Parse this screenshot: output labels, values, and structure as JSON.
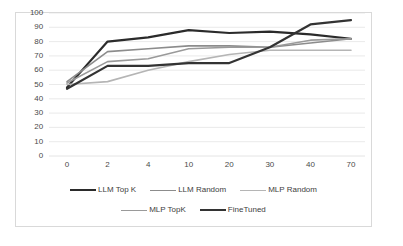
{
  "chart_data": {
    "type": "line",
    "title": "",
    "subtitle": "",
    "xlabel": "",
    "ylabel": "",
    "categories": [
      "0",
      "2",
      "4",
      "10",
      "20",
      "30",
      "40",
      "70"
    ],
    "ylim": [
      0,
      100
    ],
    "y_ticks": [
      "0",
      "10",
      "20",
      "30",
      "40",
      "50",
      "60",
      "70",
      "80",
      "90",
      "100"
    ],
    "grid": "horizontal",
    "legend_position": "bottom",
    "series": [
      {
        "name": "LLM Top K",
        "color": "#2b2b2b",
        "width": 2.2,
        "values": [
          48,
          80,
          83,
          88,
          86,
          87,
          85,
          82
        ]
      },
      {
        "name": "LLM Random",
        "color": "#8c8c8c",
        "width": 1.6,
        "values": [
          52,
          73,
          75,
          77,
          77,
          76,
          79,
          82
        ]
      },
      {
        "name": "MLP Random",
        "color": "#b5b5b5",
        "width": 1.6,
        "values": [
          50,
          52,
          60,
          66,
          71,
          74,
          74,
          74
        ]
      },
      {
        "name": "MLP TopK",
        "color": "#9a9a9a",
        "width": 1.6,
        "values": [
          51,
          66,
          68,
          75,
          76,
          76,
          81,
          82
        ]
      },
      {
        "name": "FineTuned",
        "color": "#333333",
        "width": 2.2,
        "values": [
          47,
          63,
          63,
          65,
          65,
          76,
          92,
          95
        ]
      }
    ]
  },
  "legend": {
    "rows": [
      [
        "LLM Top K",
        "LLM Random",
        "MLP Random"
      ],
      [
        "MLP TopK",
        "FineTuned"
      ]
    ]
  },
  "colors": {
    "plot_border": "#d9d9d9",
    "gridline": "#e4e4e4",
    "tick_text": "#4a4a4a",
    "background": "#ffffff"
  }
}
